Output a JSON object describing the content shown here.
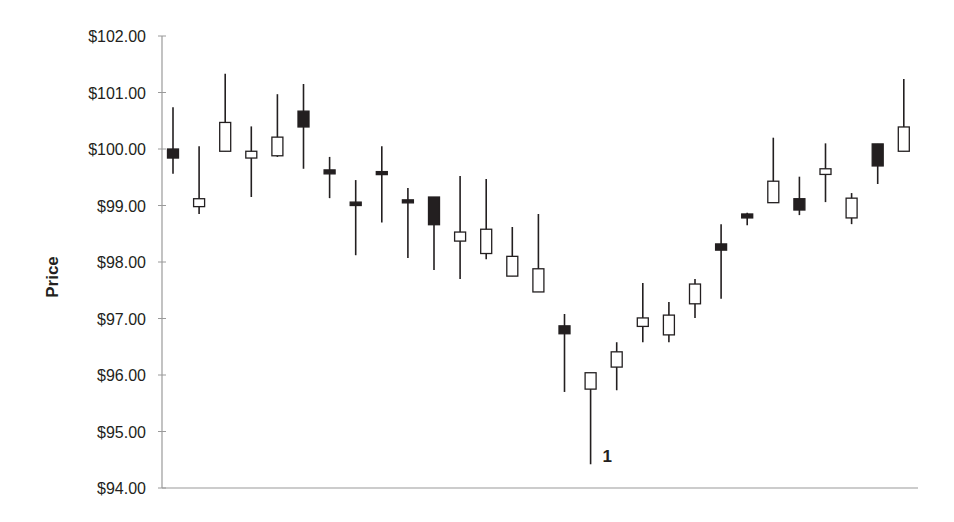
{
  "chart_data": {
    "type": "candlestick",
    "title": "",
    "xlabel": "",
    "ylabel": "Price",
    "ylim": [
      94,
      102
    ],
    "yticks": [
      94,
      95,
      96,
      97,
      98,
      99,
      100,
      101,
      102
    ],
    "ytick_labels": [
      "$94.00",
      "$95.00",
      "$96.00",
      "$97.00",
      "$98.00",
      "$99.00",
      "$100.00",
      "$101.00",
      "$102.00"
    ],
    "grid": false,
    "legend": null,
    "colors": {
      "bearish_fill": "#231f20",
      "bullish_fill": "#ffffff",
      "outline": "#231f20",
      "axis": "#9a9a9a"
    },
    "candles": [
      {
        "i": 1,
        "open": 100.0,
        "high": 100.74,
        "low": 99.56,
        "close": 99.84
      },
      {
        "i": 2,
        "open": 98.98,
        "high": 100.05,
        "low": 98.85,
        "close": 99.12
      },
      {
        "i": 3,
        "open": 99.96,
        "high": 101.33,
        "low": 99.96,
        "close": 100.47
      },
      {
        "i": 4,
        "open": 99.84,
        "high": 100.4,
        "low": 99.15,
        "close": 99.96
      },
      {
        "i": 5,
        "open": 99.88,
        "high": 100.97,
        "low": 99.86,
        "close": 100.21
      },
      {
        "i": 6,
        "open": 100.67,
        "high": 101.15,
        "low": 99.65,
        "close": 100.39
      },
      {
        "i": 7,
        "open": 99.63,
        "high": 99.86,
        "low": 99.13,
        "close": 99.56
      },
      {
        "i": 8,
        "open": 99.06,
        "high": 99.45,
        "low": 98.12,
        "close": 99.0
      },
      {
        "i": 9,
        "open": 99.6,
        "high": 100.05,
        "low": 98.7,
        "close": 99.55
      },
      {
        "i": 10,
        "open": 99.1,
        "high": 99.31,
        "low": 98.07,
        "close": 99.08
      },
      {
        "i": 11,
        "open": 99.15,
        "high": 99.15,
        "low": 97.86,
        "close": 98.66
      },
      {
        "i": 12,
        "open": 98.37,
        "high": 99.52,
        "low": 97.7,
        "close": 98.53
      },
      {
        "i": 13,
        "open": 98.15,
        "high": 99.47,
        "low": 98.05,
        "close": 98.58
      },
      {
        "i": 14,
        "open": 97.75,
        "high": 98.62,
        "low": 97.75,
        "close": 98.1
      },
      {
        "i": 15,
        "open": 97.47,
        "high": 98.85,
        "low": 97.47,
        "close": 97.88
      },
      {
        "i": 16,
        "open": 96.87,
        "high": 97.08,
        "low": 95.7,
        "close": 96.73
      },
      {
        "i": 17,
        "open": 95.75,
        "high": 96.04,
        "low": 94.42,
        "close": 96.04
      },
      {
        "i": 18,
        "open": 96.14,
        "high": 96.58,
        "low": 95.73,
        "close": 96.41
      },
      {
        "i": 19,
        "open": 96.86,
        "high": 97.63,
        "low": 96.58,
        "close": 97.01
      },
      {
        "i": 20,
        "open": 96.71,
        "high": 97.29,
        "low": 96.58,
        "close": 97.06
      },
      {
        "i": 21,
        "open": 97.26,
        "high": 97.7,
        "low": 97.01,
        "close": 97.61
      },
      {
        "i": 22,
        "open": 98.32,
        "high": 98.67,
        "low": 97.35,
        "close": 98.21
      },
      {
        "i": 23,
        "open": 98.85,
        "high": 98.87,
        "low": 98.65,
        "close": 98.78
      },
      {
        "i": 24,
        "open": 99.05,
        "high": 100.2,
        "low": 99.05,
        "close": 99.43
      },
      {
        "i": 25,
        "open": 99.12,
        "high": 99.51,
        "low": 98.83,
        "close": 98.92
      },
      {
        "i": 26,
        "open": 99.55,
        "high": 100.1,
        "low": 99.06,
        "close": 99.65
      },
      {
        "i": 27,
        "open": 98.78,
        "high": 99.22,
        "low": 98.67,
        "close": 99.13
      },
      {
        "i": 28,
        "open": 100.09,
        "high": 100.09,
        "low": 99.38,
        "close": 99.7
      },
      {
        "i": 29,
        "open": 99.96,
        "high": 101.24,
        "low": 99.96,
        "close": 100.39
      }
    ],
    "annotations": [
      {
        "text": "1",
        "candle": 17,
        "note": "label beside low wick of candle 17"
      }
    ]
  }
}
